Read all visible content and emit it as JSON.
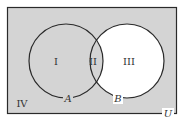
{
  "diagram": {
    "type": "venn",
    "universe_label": "U",
    "sets": [
      {
        "name": "A",
        "label": "A"
      },
      {
        "name": "B",
        "label": "B"
      }
    ],
    "regions": [
      {
        "id": "I",
        "label": "I",
        "description": "A only",
        "shaded": true
      },
      {
        "id": "II",
        "label": "II",
        "description": "A and B",
        "shaded": true
      },
      {
        "id": "III",
        "label": "III",
        "description": "B only",
        "shaded": false
      },
      {
        "id": "IV",
        "label": "IV",
        "description": "outside A and B",
        "shaded": true
      }
    ],
    "colors": {
      "shade": "#d4d4d4",
      "unshaded": "#ffffff",
      "stroke": "#2a2a2a"
    }
  }
}
